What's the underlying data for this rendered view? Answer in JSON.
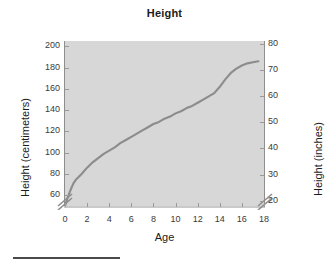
{
  "chart_data": {
    "type": "line",
    "title": "Height",
    "xlabel": "Age",
    "ylabel": "Height (centimeters)",
    "ylabel_secondary": "Height (inches)",
    "xlim": [
      0,
      18
    ],
    "ylim": [
      50,
      205
    ],
    "ylim_secondary": [
      18,
      81
    ],
    "grid": false,
    "legend": null,
    "axis_break_left": true,
    "axis_break_right": true,
    "xticks": [
      0,
      2,
      4,
      6,
      8,
      10,
      12,
      14,
      16,
      18
    ],
    "xtick_labels": [
      "0",
      "2",
      "4",
      "6",
      "8",
      "10",
      "12",
      "14",
      "16",
      "18"
    ],
    "yticks": [
      60,
      80,
      100,
      120,
      140,
      160,
      180,
      200
    ],
    "ytick_labels": [
      "60",
      "80",
      "100",
      "120",
      "140",
      "160",
      "180",
      "200"
    ],
    "yticks_secondary": [
      20,
      30,
      40,
      50,
      60,
      70,
      80
    ],
    "ytick_labels_secondary": [
      "20",
      "30",
      "40",
      "50",
      "60",
      "70",
      "80"
    ],
    "line_color": "#8c8c8c",
    "plot_background": "#d7d7d7",
    "series": [
      {
        "name": "Height",
        "x": [
          0.0,
          0.25,
          0.5,
          0.75,
          1.0,
          1.5,
          2.0,
          2.5,
          3.0,
          3.5,
          4.0,
          4.5,
          5.0,
          5.5,
          6.0,
          6.5,
          7.0,
          7.5,
          8.0,
          8.5,
          9.0,
          9.5,
          10.0,
          10.5,
          11.0,
          11.5,
          12.0,
          12.5,
          13.0,
          13.5,
          14.0,
          14.5,
          15.0,
          15.5,
          16.0,
          16.5,
          17.0,
          17.5
        ],
        "values": [
          50,
          58,
          65,
          71,
          75,
          80,
          86,
          91,
          95,
          99,
          102,
          105,
          109,
          112,
          115,
          118,
          121,
          124,
          127,
          129,
          132,
          134,
          137,
          139,
          142,
          144,
          147,
          150,
          153,
          156,
          162,
          169,
          175,
          179,
          182,
          184,
          185,
          186
        ]
      }
    ]
  },
  "footer": {
    "rule_label": "horizontal-rule"
  }
}
